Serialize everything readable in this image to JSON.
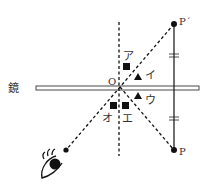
{
  "diagram": {
    "mirror_label": "鏡",
    "origin_label": "O",
    "point_p_label": "P",
    "point_p_prime_label": "P´",
    "candidates": [
      {
        "label": "ア",
        "shape": "square"
      },
      {
        "label": "イ",
        "shape": "triangle"
      },
      {
        "label": "ウ",
        "shape": "triangle"
      },
      {
        "label": "エ",
        "shape": "square"
      },
      {
        "label": "オ",
        "shape": "square"
      }
    ],
    "observer_icon": "eye-icon",
    "colors": {
      "ink": "#111111",
      "mirror_fill": "#ffffff",
      "text": "#333333"
    }
  }
}
